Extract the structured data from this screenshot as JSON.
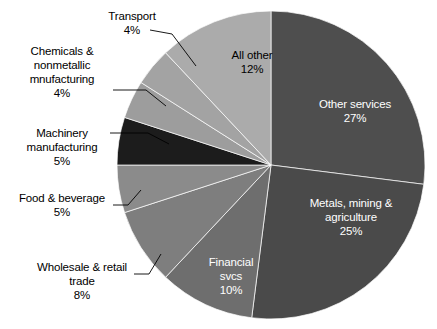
{
  "figure": {
    "width": 437,
    "height": 329,
    "background": "#ffffff",
    "caption": ""
  },
  "chart_data": {
    "type": "pie",
    "title": "",
    "subtitle": "",
    "xlabel": "",
    "ylabel": "",
    "legend_position": "none",
    "grid": false,
    "units": "percent",
    "total": 100,
    "start_angle_deg": 0,
    "direction": "clockwise",
    "categories": [
      "Other services",
      "Metals, mining & agriculture",
      "Financial svcs",
      "Wholesale & retail trade",
      "Food & beverage",
      "Machinery manufacturing",
      "Chemicals & nonmetallic mnufacturing",
      "Transport",
      "All other"
    ],
    "values": [
      27,
      25,
      10,
      8,
      5,
      5,
      4,
      4,
      12
    ],
    "colors": [
      "#4e4e4e",
      "#4a4a4a",
      "#6e6e6e",
      "#7e7e7e",
      "#8b8b8b",
      "#1c1c1c",
      "#9d9d9d",
      "#a3a3a3",
      "#ababab"
    ],
    "slices": [
      {
        "label": "Other services",
        "value": 27,
        "value_text": "27%",
        "label_text": "Other services\n27%",
        "color": "#4e4e4e",
        "label_placement": "inside",
        "text_color": "#ffffff"
      },
      {
        "label": "Metals, mining & agriculture",
        "value": 25,
        "value_text": "25%",
        "label_text": "Metals, mining &\nagriculture\n25%",
        "color": "#4a4a4a",
        "label_placement": "inside",
        "text_color": "#ffffff"
      },
      {
        "label": "Financial svcs",
        "value": 10,
        "value_text": "10%",
        "label_text": "Financial\nsvcs\n10%",
        "color": "#6e6e6e",
        "label_placement": "inside",
        "text_color": "#ffffff"
      },
      {
        "label": "Wholesale & retail trade",
        "value": 8,
        "value_text": "8%",
        "label_text": "Wholesale & retail\ntrade\n8%",
        "color": "#7e7e7e",
        "label_placement": "outside",
        "text_color": "#000000"
      },
      {
        "label": "Food & beverage",
        "value": 5,
        "value_text": "5%",
        "label_text": "Food & beverage\n5%",
        "color": "#8b8b8b",
        "label_placement": "outside",
        "text_color": "#000000"
      },
      {
        "label": "Machinery manufacturing",
        "value": 5,
        "value_text": "5%",
        "label_text": "Machinery\nmanufacturing\n5%",
        "color": "#1c1c1c",
        "label_placement": "outside",
        "text_color": "#000000"
      },
      {
        "label": "Chemicals & nonmetallic mnufacturing",
        "value": 4,
        "value_text": "4%",
        "label_text": "Chemicals &\nnonmetallic\nmnufacturing\n4%",
        "color": "#9d9d9d",
        "label_placement": "outside",
        "text_color": "#000000"
      },
      {
        "label": "Transport",
        "value": 4,
        "value_text": "4%",
        "label_text": "Transport\n4%",
        "color": "#a3a3a3",
        "label_placement": "outside",
        "text_color": "#000000"
      },
      {
        "label": "All other",
        "value": 12,
        "value_text": "12%",
        "label_text": "All other\n12%",
        "color": "#ababab",
        "label_placement": "inside",
        "text_color": "#000000"
      }
    ]
  }
}
